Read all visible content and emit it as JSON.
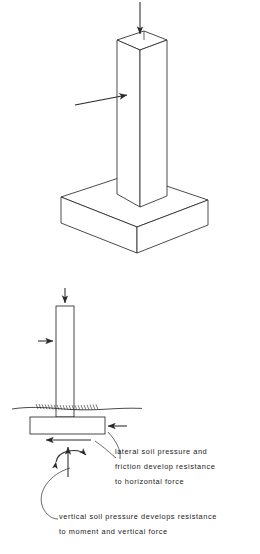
{
  "figure": {
    "ink_color": "#2a2a2a",
    "line_width": 0.8,
    "upper_view": {
      "name": "isometric pad footing with column",
      "loads": [
        {
          "name": "vertical-load-arrow",
          "direction": "down",
          "applied_at": "column top"
        },
        {
          "name": "horizontal-load-arrow",
          "direction": "right",
          "applied_at": "column side"
        }
      ]
    },
    "lower_view": {
      "name": "section of spread footing in soil",
      "ground_line_label": "",
      "loads": [
        {
          "name": "vertical-load-arrow",
          "direction": "down",
          "applied_at": "column top"
        },
        {
          "name": "horizontal-load-arrow",
          "direction": "right",
          "applied_at": "column side"
        },
        {
          "name": "lateral-soil-pressure-arrow",
          "direction": "left",
          "applied_at": "footing right edge"
        },
        {
          "name": "friction-arrow",
          "direction": "left",
          "applied_at": "footing underside"
        },
        {
          "name": "vertical-soil-pressure-arrow",
          "direction": "up",
          "applied_at": "footing underside"
        },
        {
          "name": "moment-arc-arrow",
          "direction": "double",
          "applied_at": "footing underside"
        }
      ]
    }
  },
  "annotations": {
    "lateral": {
      "lines": [
        "lateral soil pressure and",
        "friction develop resistance",
        "to horizontal force"
      ]
    },
    "vertical": {
      "lines": [
        "vertical soil pressure develops resistance",
        "to moment and vertical force"
      ]
    }
  }
}
